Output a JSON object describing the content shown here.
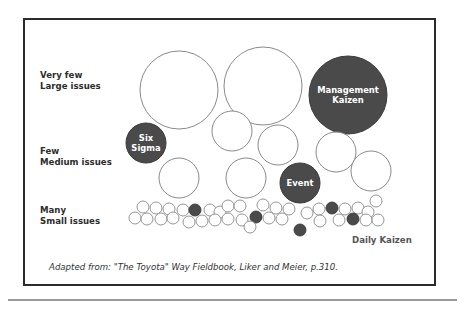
{
  "diagram": {
    "row_labels": [
      {
        "line1": "Very few",
        "line2": "Large issues",
        "top": 70
      },
      {
        "line1": "Few",
        "line2": "Medium issues",
        "top": 146
      },
      {
        "line1": "Many",
        "line2": "Small issues",
        "top": 205
      }
    ],
    "daily_kaizen_label": "Daily Kaizen",
    "caption": "Adapted from:  \"The Toyota\" Way Fieldbook, Liker and Meier, p.310.",
    "colors": {
      "outline": "#8a8a8a",
      "filled": "#4a4a4a",
      "frame": "#2b2b2b",
      "text_dark": "#2d2d2d"
    },
    "large_circles": [
      {
        "cx": 179,
        "cy": 90,
        "r": 39,
        "filled": false,
        "label": []
      },
      {
        "cx": 263,
        "cy": 86,
        "r": 39,
        "filled": false,
        "label": []
      },
      {
        "cx": 348,
        "cy": 95,
        "r": 39,
        "filled": true,
        "label": [
          "Management",
          "Kaizen"
        ]
      }
    ],
    "medium_circles": [
      {
        "cx": 146,
        "cy": 143,
        "r": 20,
        "filled": true,
        "label": [
          "Six",
          "Sigma"
        ]
      },
      {
        "cx": 232,
        "cy": 131,
        "r": 20,
        "filled": false,
        "label": []
      },
      {
        "cx": 278,
        "cy": 145,
        "r": 20,
        "filled": false,
        "label": []
      },
      {
        "cx": 336,
        "cy": 152,
        "r": 20,
        "filled": false,
        "label": []
      },
      {
        "cx": 371,
        "cy": 171,
        "r": 20,
        "filled": false,
        "label": []
      },
      {
        "cx": 179,
        "cy": 178,
        "r": 20,
        "filled": false,
        "label": []
      },
      {
        "cx": 246,
        "cy": 178,
        "r": 20,
        "filled": false,
        "label": []
      },
      {
        "cx": 300,
        "cy": 183,
        "r": 20,
        "filled": true,
        "label": [
          "Event"
        ]
      }
    ],
    "small_circles": [
      {
        "cx": 143,
        "cy": 207,
        "filled": false
      },
      {
        "cx": 156,
        "cy": 208,
        "filled": false
      },
      {
        "cx": 169,
        "cy": 209,
        "filled": false
      },
      {
        "cx": 183,
        "cy": 210,
        "filled": false
      },
      {
        "cx": 195,
        "cy": 210,
        "filled": true
      },
      {
        "cx": 210,
        "cy": 210,
        "filled": false
      },
      {
        "cx": 220,
        "cy": 212,
        "filled": false
      },
      {
        "cx": 228,
        "cy": 206,
        "filled": false
      },
      {
        "cx": 240,
        "cy": 206,
        "filled": false
      },
      {
        "cx": 263,
        "cy": 205,
        "filled": false
      },
      {
        "cx": 276,
        "cy": 208,
        "filled": false
      },
      {
        "cx": 289,
        "cy": 209,
        "filled": false
      },
      {
        "cx": 319,
        "cy": 209,
        "filled": false
      },
      {
        "cx": 332,
        "cy": 208,
        "filled": true
      },
      {
        "cx": 345,
        "cy": 209,
        "filled": false
      },
      {
        "cx": 358,
        "cy": 208,
        "filled": false
      },
      {
        "cx": 368,
        "cy": 212,
        "filled": false
      },
      {
        "cx": 376,
        "cy": 201,
        "filled": false
      },
      {
        "cx": 135,
        "cy": 218,
        "filled": false
      },
      {
        "cx": 147,
        "cy": 219,
        "filled": false
      },
      {
        "cx": 161,
        "cy": 219,
        "filled": false
      },
      {
        "cx": 173,
        "cy": 218,
        "filled": false
      },
      {
        "cx": 189,
        "cy": 222,
        "filled": false
      },
      {
        "cx": 202,
        "cy": 221,
        "filled": false
      },
      {
        "cx": 215,
        "cy": 220,
        "filled": false
      },
      {
        "cx": 228,
        "cy": 219,
        "filled": false
      },
      {
        "cx": 242,
        "cy": 220,
        "filled": false
      },
      {
        "cx": 256,
        "cy": 217,
        "filled": true
      },
      {
        "cx": 269,
        "cy": 218,
        "filled": false
      },
      {
        "cx": 282,
        "cy": 219,
        "filled": false
      },
      {
        "cx": 250,
        "cy": 227,
        "filled": false
      },
      {
        "cx": 300,
        "cy": 230,
        "filled": true
      },
      {
        "cx": 307,
        "cy": 213,
        "filled": false
      },
      {
        "cx": 320,
        "cy": 221,
        "filled": false
      },
      {
        "cx": 339,
        "cy": 220,
        "filled": false
      },
      {
        "cx": 353,
        "cy": 219,
        "filled": true
      },
      {
        "cx": 366,
        "cy": 220,
        "filled": false
      },
      {
        "cx": 378,
        "cy": 220,
        "filled": false
      }
    ],
    "small_radius": 6
  }
}
